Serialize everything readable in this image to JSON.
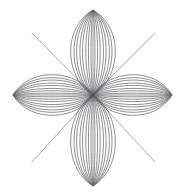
{
  "figure": {
    "kind": "line-drawing",
    "background_color": "#ffffff",
    "stroke_color": "#5f5f63",
    "ray_stroke_color": "#85858a",
    "stroke_width": 0.7,
    "canvas": {
      "width": 187,
      "height": 195
    },
    "center": {
      "x": 93,
      "y": 95
    },
    "petal_count": 4,
    "curves_per_petal": 8,
    "ray_count": 4,
    "tips": {
      "top": {
        "x": 93,
        "y": 10
      },
      "bottom": {
        "x": 93,
        "y": 186
      },
      "left": {
        "x": 13,
        "y": 95
      },
      "right": {
        "x": 172,
        "y": 95
      }
    },
    "rays": [
      {
        "name": "ray-top-left",
        "x1": 93,
        "y1": 95,
        "x2": 32,
        "y2": 33
      },
      {
        "name": "ray-top-right",
        "x1": 93,
        "y1": 95,
        "x2": 155,
        "y2": 33
      },
      {
        "name": "ray-bottom-left",
        "x1": 93,
        "y1": 95,
        "x2": 32,
        "y2": 162
      },
      {
        "name": "ray-bottom-right",
        "x1": 93,
        "y1": 95,
        "x2": 155,
        "y2": 162
      }
    ],
    "petals": [
      {
        "name": "petal-top",
        "direction": "up",
        "length": 85,
        "max_half_width": 34
      },
      {
        "name": "petal-bottom",
        "direction": "down",
        "length": 91,
        "max_half_width": 34
      },
      {
        "name": "petal-left",
        "direction": "left",
        "length": 80,
        "max_half_width": 31
      },
      {
        "name": "petal-right",
        "direction": "right",
        "length": 79,
        "max_half_width": 31
      }
    ],
    "curve_widths": [
      3,
      7,
      11,
      16,
      20,
      25,
      29,
      34
    ]
  }
}
